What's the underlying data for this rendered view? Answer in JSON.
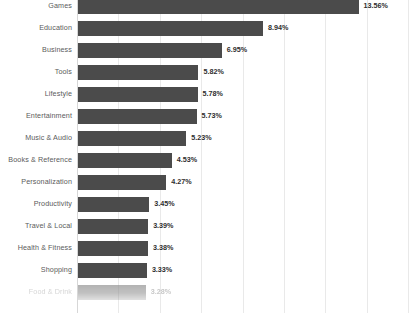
{
  "chart_data": {
    "type": "bar",
    "orientation": "horizontal",
    "title": "",
    "subtitle": "",
    "xlabel": "",
    "ylabel": "",
    "categories": [
      "Games",
      "Education",
      "Business",
      "Tools",
      "Lifestyle",
      "Entertainment",
      "Music & Audio",
      "Books & Reference",
      "Personalization",
      "Productivity",
      "Travel & Local",
      "Health & Fitness",
      "Shopping",
      "Food & Drink"
    ],
    "values": [
      13.56,
      8.94,
      6.95,
      5.82,
      5.78,
      5.73,
      5.23,
      4.53,
      4.27,
      3.45,
      3.39,
      3.38,
      3.33,
      3.28
    ],
    "value_labels": [
      "13.56%",
      "8.94%",
      "6.95%",
      "5.82%",
      "5.78%",
      "5.73%",
      "5.23%",
      "4.53%",
      "4.27%",
      "3.45%",
      "3.39%",
      "3.38%",
      "3.33%",
      "3.28%"
    ],
    "unit": "%",
    "xlim": [
      0,
      16.0
    ],
    "gridline_values": [
      2.0,
      4.0,
      6.0,
      8.0,
      10.0,
      12.0,
      14.0,
      16.0
    ],
    "grid": true,
    "grid_axis": "x",
    "tick_labels_visible": false,
    "legend": false,
    "legend_position": "none",
    "colors": {
      "bar": "#4b4b4b",
      "bar_faded": "#8f8f8f",
      "gridline": "#e9e9e9",
      "axis": "#d7d7d7",
      "category_label": "#5b5b5b",
      "category_label_faded": "#b6b6b6",
      "value_label": "#2e2e2e",
      "background": "#ffffff"
    }
  }
}
